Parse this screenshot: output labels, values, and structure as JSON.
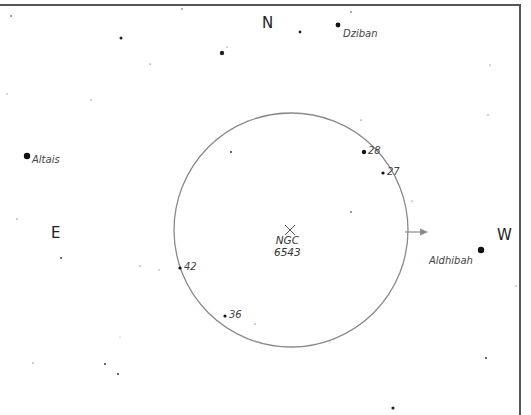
{
  "chart_title": "",
  "directions": {
    "north": "N",
    "east": "E",
    "west": "W"
  },
  "target": {
    "name_line1": "NGC",
    "name_line2": "6543",
    "marker": "x-mark"
  },
  "field_circle": {
    "center": [
      291,
      230
    ],
    "radius": 117,
    "color": "#8a8a8a"
  },
  "motion_arrow": {
    "from": [
      405,
      232
    ],
    "to": [
      428,
      232
    ],
    "color": "#8a8a8a"
  },
  "named_stars": [
    {
      "name": "Dziban",
      "x": 338,
      "y": 25,
      "r": 2.4
    },
    {
      "name": "Altais",
      "x": 27,
      "y": 156,
      "r": 3.2
    },
    {
      "name": "Aldhibah",
      "x": 481,
      "y": 250,
      "r": 3.2
    }
  ],
  "numbered_stars": [
    {
      "label": "28",
      "x": 364,
      "y": 152,
      "r": 2.2
    },
    {
      "label": "27",
      "x": 383,
      "y": 173,
      "r": 1.6
    },
    {
      "label": "42",
      "x": 180,
      "y": 268,
      "r": 1.6
    },
    {
      "label": "36",
      "x": 225,
      "y": 316,
      "r": 1.6
    }
  ],
  "field_stars": [
    {
      "x": 11,
      "y": 16,
      "r": 0.8
    },
    {
      "x": 121,
      "y": 38,
      "r": 1.5
    },
    {
      "x": 222,
      "y": 53,
      "r": 2.2
    },
    {
      "x": 227,
      "y": 47,
      "r": 0.5
    },
    {
      "x": 182,
      "y": 9,
      "r": 0.7
    },
    {
      "x": 150,
      "y": 64,
      "r": 0.6
    },
    {
      "x": 91,
      "y": 100,
      "r": 0.6
    },
    {
      "x": 300,
      "y": 32,
      "r": 1.4
    },
    {
      "x": 351,
      "y": 12,
      "r": 0.7
    },
    {
      "x": 490,
      "y": 65,
      "r": 0.5
    },
    {
      "x": 488,
      "y": 115,
      "r": 0.6
    },
    {
      "x": 361,
      "y": 120,
      "r": 0.6
    },
    {
      "x": 7,
      "y": 94,
      "r": 0.5
    },
    {
      "x": 231,
      "y": 152,
      "r": 0.9
    },
    {
      "x": 351,
      "y": 212,
      "r": 0.8
    },
    {
      "x": 412,
      "y": 201,
      "r": 0.5
    },
    {
      "x": 17,
      "y": 219,
      "r": 0.6
    },
    {
      "x": 61,
      "y": 258,
      "r": 0.9
    },
    {
      "x": 140,
      "y": 266,
      "r": 0.6
    },
    {
      "x": 159,
      "y": 270,
      "r": 0.5
    },
    {
      "x": 255,
      "y": 324,
      "r": 0.6
    },
    {
      "x": 33,
      "y": 363,
      "r": 0.6
    },
    {
      "x": 105,
      "y": 364,
      "r": 0.9
    },
    {
      "x": 118,
      "y": 374,
      "r": 0.9
    },
    {
      "x": 486,
      "y": 358,
      "r": 0.9
    },
    {
      "x": 516,
      "y": 286,
      "r": 0.5
    },
    {
      "x": 393,
      "y": 408,
      "r": 1.6
    },
    {
      "x": 120,
      "y": 337,
      "r": 0.4
    },
    {
      "x": 330,
      "y": 342,
      "r": 0.4
    }
  ],
  "text_positions": {
    "north": [
      262,
      14
    ],
    "east": [
      51,
      224
    ],
    "west": [
      497,
      226
    ],
    "target_label": [
      274,
      234
    ],
    "target_x": [
      290,
      230
    ]
  }
}
